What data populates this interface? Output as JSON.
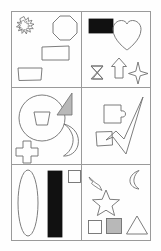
{
  "figure": {
    "canvas": {
      "width": 161,
      "height": 251
    },
    "frame": {
      "x": 11,
      "y": 11,
      "width": 140,
      "height": 230,
      "stroke": "#9a9a9a",
      "stroke_width": 1
    },
    "grid": {
      "rows": 3,
      "columns": 2,
      "divider_color": "#9a9a9a"
    },
    "colors": {
      "background": "#fefefe",
      "outline": "#6e6e6e",
      "fill_black": "#111111",
      "fill_gray": "#b8b8b8",
      "frame": "#9a9a9a"
    },
    "panels": [
      {
        "id": "panel-top-left",
        "row": 1,
        "column": 1,
        "shape_count": 4,
        "shapes": [
          {
            "name": "starburst",
            "label": "starburst",
            "fill": "none",
            "stroke": "#6e6e6e"
          },
          {
            "name": "octagon",
            "label": "octagon",
            "fill": "none",
            "stroke": "#6e6e6e"
          },
          {
            "name": "rectangle",
            "label": "rectangle",
            "fill": "none",
            "stroke": "#6e6e6e"
          },
          {
            "name": "trapezoid",
            "label": "trapezoid",
            "fill": "none",
            "stroke": "#6e6e6e"
          }
        ]
      },
      {
        "id": "panel-top-right",
        "row": 1,
        "column": 2,
        "shape_count": 5,
        "shapes": [
          {
            "name": "filled-rectangle",
            "label": "filled rectangle",
            "fill": "#111111",
            "stroke": "#111111"
          },
          {
            "name": "heart",
            "label": "heart",
            "fill": "none",
            "stroke": "#6e6e6e"
          },
          {
            "name": "hourglass",
            "label": "hourglass",
            "fill": "none",
            "stroke": "#6e6e6e"
          },
          {
            "name": "up-arrow",
            "label": "up arrow",
            "fill": "none",
            "stroke": "#6e6e6e"
          },
          {
            "name": "four-point-star",
            "label": "four-pointed star",
            "fill": "none",
            "stroke": "#6e6e6e"
          }
        ]
      },
      {
        "id": "panel-middle-left",
        "row": 2,
        "column": 1,
        "shape_count": 4,
        "shapes": [
          {
            "name": "circle",
            "label": "circle",
            "fill": "none",
            "stroke": "#6e6e6e"
          },
          {
            "name": "inner-trapezoid",
            "label": "trapezoid inside circle",
            "fill": "none",
            "stroke": "#6e6e6e"
          },
          {
            "name": "right-triangle",
            "label": "shaded right triangle",
            "fill": "#b8b8b8",
            "stroke": "#6e6e6e"
          },
          {
            "name": "crescent-moon",
            "label": "crescent moon",
            "fill": "none",
            "stroke": "#6e6e6e"
          },
          {
            "name": "cross",
            "label": "cross",
            "fill": "none",
            "stroke": "#6e6e6e"
          }
        ]
      },
      {
        "id": "panel-middle-right",
        "row": 2,
        "column": 2,
        "shape_count": 3,
        "shapes": [
          {
            "name": "puzzle-piece",
            "label": "puzzle piece square with tab",
            "fill": "none",
            "stroke": "#6e6e6e"
          },
          {
            "name": "quadrilateral",
            "label": "small quadrilateral",
            "fill": "none",
            "stroke": "#6e6e6e"
          },
          {
            "name": "checkmark",
            "label": "checkmark",
            "fill": "none",
            "stroke": "#6e6e6e"
          }
        ]
      },
      {
        "id": "panel-bottom-left",
        "row": 3,
        "column": 1,
        "shape_count": 3,
        "shapes": [
          {
            "name": "tall-ellipse",
            "label": "tall ellipse",
            "fill": "none",
            "stroke": "#6e6e6e"
          },
          {
            "name": "filled-bar",
            "label": "tall filled bar",
            "fill": "#111111",
            "stroke": "#111111"
          },
          {
            "name": "small-square",
            "label": "small square",
            "fill": "none",
            "stroke": "#6e6e6e"
          }
        ]
      },
      {
        "id": "panel-bottom-right",
        "row": 3,
        "column": 2,
        "shape_count": 6,
        "shapes": [
          {
            "name": "lightning-bolt",
            "label": "lightning bolt",
            "fill": "none",
            "stroke": "#6e6e6e"
          },
          {
            "name": "crescent-moon",
            "label": "crescent moon",
            "fill": "none",
            "stroke": "#6e6e6e"
          },
          {
            "name": "five-point-star",
            "label": "five-pointed star",
            "fill": "none",
            "stroke": "#6e6e6e"
          },
          {
            "name": "small-square",
            "label": "small square",
            "fill": "none",
            "stroke": "#6e6e6e"
          },
          {
            "name": "shaded-square",
            "label": "shaded square",
            "fill": "#b8b8b8",
            "stroke": "#6e6e6e"
          },
          {
            "name": "triangle",
            "label": "triangle",
            "fill": "none",
            "stroke": "#6e6e6e"
          }
        ]
      }
    ]
  }
}
